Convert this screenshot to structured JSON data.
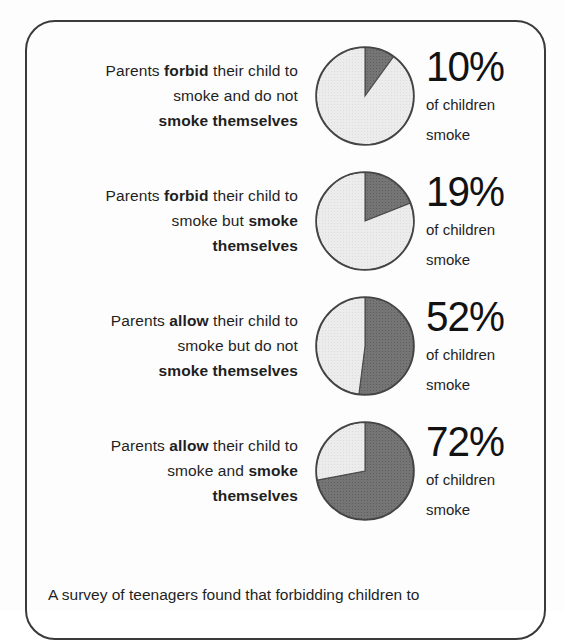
{
  "caption": "A survey of teenagers found that forbidding children to",
  "colors": {
    "slice_smoke": "#6f6f6f",
    "slice_nonsmoke": "#e9e9e9",
    "outline": "#444444",
    "card_border": "#3a3a3a",
    "text": "#1f1f1f"
  },
  "rows": [
    {
      "label_html": "Parents <b>forbid</b> their child to smoke and do not smoke themselves",
      "label_lines": [
        "Parents forbid their child to",
        "smoke and do not",
        "smoke themselves"
      ],
      "percent": "10%",
      "percent_value": 10,
      "sub_line_1": "of children",
      "sub_line_2": "smoke"
    },
    {
      "label_html": "Parents <b>forbid</b> their child to smoke but <b>smoke themselves</b>",
      "label_lines": [
        "Parents forbid their child to",
        "smoke but smoke",
        "themselves"
      ],
      "percent": "19%",
      "percent_value": 19,
      "sub_line_1": "of children",
      "sub_line_2": "smoke"
    },
    {
      "label_html": "Parents <b>allow</b> their child to smoke but do not smoke themselves",
      "label_lines": [
        "Parents allow their child to",
        "smoke but do not",
        "smoke themselves"
      ],
      "percent": "52%",
      "percent_value": 52,
      "sub_line_1": "of children",
      "sub_line_2": "smoke"
    },
    {
      "label_html": "Parents <b>allow</b> their child to smoke and <b>smoke themselves</b>",
      "label_lines": [
        "Parents allow their child to",
        "smoke and smoke",
        "themselves"
      ],
      "percent": "72%",
      "percent_value": 72,
      "sub_line_1": "of children",
      "sub_line_2": "smoke"
    }
  ],
  "chart_data": {
    "type": "pie",
    "subtitle": "A survey of teenagers found that forbidding children to",
    "xlabel": "",
    "ylabel": "",
    "legend_position": "none",
    "grid": false,
    "units": "percent of children who smoke",
    "slice_labels": [
      "of children smoke",
      "do not smoke"
    ],
    "categories": [
      "Parents forbid their child to smoke and do not smoke themselves",
      "Parents forbid their child to smoke but smoke themselves",
      "Parents allow their child to smoke but do not smoke themselves",
      "Parents allow their child to smoke and smoke themselves"
    ],
    "values": [
      10,
      19,
      52,
      72
    ],
    "charts": [
      {
        "label": "Parents forbid their child to smoke and do not smoke themselves",
        "slices": [
          {
            "name": "of children smoke",
            "value": 10
          },
          {
            "name": "do not smoke",
            "value": 90
          }
        ]
      },
      {
        "label": "Parents forbid their child to smoke but smoke themselves",
        "slices": [
          {
            "name": "of children smoke",
            "value": 19
          },
          {
            "name": "do not smoke",
            "value": 81
          }
        ]
      },
      {
        "label": "Parents allow their child to smoke but do not smoke themselves",
        "slices": [
          {
            "name": "of children smoke",
            "value": 52
          },
          {
            "name": "do not smoke",
            "value": 48
          }
        ]
      },
      {
        "label": "Parents allow their child to smoke and smoke themselves",
        "slices": [
          {
            "name": "of children smoke",
            "value": 72
          },
          {
            "name": "do not smoke",
            "value": 28
          }
        ]
      }
    ]
  }
}
